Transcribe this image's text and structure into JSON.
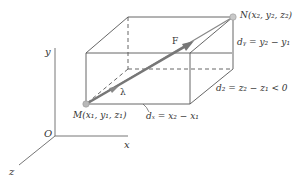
{
  "diagram": {
    "axes": {
      "x_label": "x",
      "y_label": "y",
      "z_label": "z",
      "origin_label": "O"
    },
    "points": {
      "M_label": "M(x₁, y₁, z₁)",
      "N_label": "N(x₂, y₂, z₂)"
    },
    "vectors": {
      "force_label": "F",
      "unit_label": "λ"
    },
    "dimensions": {
      "dx_label": "dₓ = x₂ − x₁",
      "dy_label": "dᵧ = y₂ − y₁",
      "dz_label": "d₂ = z₂ − z₁ < 0"
    },
    "colors": {
      "line": "#555555",
      "force_arrow": "#777777",
      "point": "#b5b5b5",
      "text": "#333333"
    }
  }
}
